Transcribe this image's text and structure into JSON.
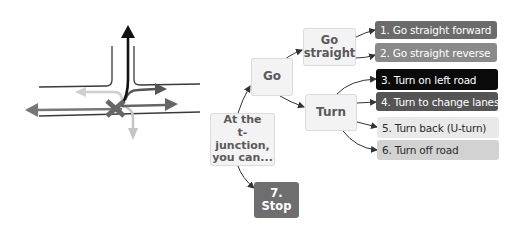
{
  "junction_diagram": {
    "description": "T-junction with movement arrows",
    "marker": "X",
    "colors": {
      "road_lines": "#3a3a3a",
      "forward_arrow": "#111111",
      "reverse_arrow": "#777777",
      "left_turn_arrow": "#555555",
      "uturn_arrow": "#cfcfcf",
      "turn_off_arrow": "#c4c4c4",
      "marker": "#666666"
    }
  },
  "flowchart": {
    "root": {
      "label": "At the t-junction, you can...",
      "lines": [
        "At the",
        "t-junction,",
        "you can..."
      ]
    },
    "go": {
      "label": "Go"
    },
    "go_straight": {
      "label": "Go straight",
      "lines": [
        "Go",
        "straight"
      ]
    },
    "turn": {
      "label": "Turn"
    },
    "stop": {
      "label": "7. Stop",
      "color": "#6e6e6e"
    },
    "options": [
      {
        "label": "1. Go straight forward",
        "color": "#6b6b6b",
        "text_color": "#ffffff",
        "parent": "go_straight"
      },
      {
        "label": "2. Go straight reverse",
        "color": "#8a8a8a",
        "text_color": "#ffffff",
        "parent": "go_straight"
      },
      {
        "label": "3. Turn on left road",
        "color": "#0a0a0a",
        "text_color": "#ffffff",
        "parent": "turn"
      },
      {
        "label": "4. Turn to change lanes",
        "color": "#555555",
        "text_color": "#ffffff",
        "parent": "turn"
      },
      {
        "label": "5. Turn back (U-turn)",
        "color": "#e9e9e9",
        "text_color": "#2a2a2a",
        "parent": "turn"
      },
      {
        "label": "6. Turn off road",
        "color": "#d2d2d2",
        "text_color": "#2a2a2a",
        "parent": "turn"
      }
    ]
  }
}
